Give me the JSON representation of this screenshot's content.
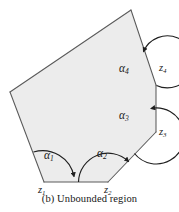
{
  "figure": {
    "caption": "(b) Unbounded region",
    "caption_label": "(b)",
    "caption_text": "Unbounded region",
    "fill_color": "#ececec",
    "stroke_color": "#5a5a5a",
    "arc_color": "#1f1f1f",
    "background_color": "#ffffff"
  },
  "vertices": [
    {
      "id": "z1",
      "symbol": "z",
      "subscript": "1",
      "x": 44,
      "y": 182
    },
    {
      "id": "z2",
      "symbol": "z",
      "subscript": "2",
      "x": 108,
      "y": 182
    },
    {
      "id": "z3",
      "symbol": "z",
      "subscript": "3",
      "x": 156,
      "y": 132
    },
    {
      "id": "z4",
      "symbol": "z",
      "subscript": "4",
      "x": 156,
      "y": 85
    }
  ],
  "angles": [
    {
      "id": "alpha1",
      "symbol": "α",
      "subscript": "1",
      "at_vertex": "z1"
    },
    {
      "id": "alpha2",
      "symbol": "α",
      "subscript": "2",
      "at_vertex": "z2"
    },
    {
      "id": "alpha3",
      "symbol": "α",
      "subscript": "3",
      "at_vertex": "z3"
    },
    {
      "id": "alpha4",
      "symbol": "α",
      "subscript": "4",
      "at_vertex": "z4"
    }
  ],
  "polygon": {
    "description": "unbounded polygonal region with four marked interior angles",
    "outline_points": "131,10 10,92 44,182 108,182 156,132 156,85",
    "unbounded_rays": [
      {
        "from": "131,10",
        "to": "10,92",
        "note": "upper-left boundary ray"
      },
      {
        "from": "131,10",
        "to": "156,85",
        "note": "upper-right boundary ray"
      }
    ]
  },
  "ghost_line": "",
  "page": {
    "width": 179,
    "height": 212
  }
}
